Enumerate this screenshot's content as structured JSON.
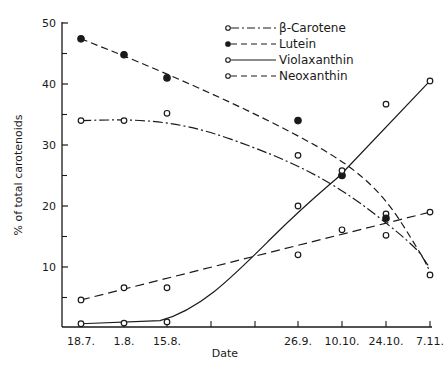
{
  "chart_data": {
    "type": "line",
    "title": "",
    "xlabel": "Date",
    "ylabel": "% of total carotenoids",
    "ylim": [
      0,
      50
    ],
    "yticks": [
      10,
      20,
      30,
      40,
      50
    ],
    "yminor_ticks": [
      5,
      15,
      25,
      35,
      45
    ],
    "grid": false,
    "legend_position": "upper right",
    "categories": [
      "18.7.",
      "1.8.",
      "15.8.",
      "26.9.",
      "10.10.",
      "24.10.",
      "7.11."
    ],
    "x_unlabeled_ticks": 2,
    "series": [
      {
        "name": "β-Carotene",
        "marker": "open-circle",
        "line": "dash-dot",
        "values": [
          34.0,
          34.0,
          35.2,
          28.3,
          25.1,
          18.7,
          8.7
        ]
      },
      {
        "name": "Lutein",
        "marker": "filled-circle",
        "line": "dashed",
        "values": [
          47.4,
          44.8,
          41.0,
          34.0,
          25.0,
          18.0,
          null
        ]
      },
      {
        "name": "Violaxanthin",
        "marker": "open-circle",
        "line": "solid",
        "values": [
          0.7,
          0.8,
          1.0,
          20.0,
          25.8,
          36.7,
          40.5
        ]
      },
      {
        "name": "Neoxanthin",
        "marker": "open-circle",
        "line": "long-dash",
        "values": [
          4.6,
          6.6,
          6.6,
          12.0,
          16.1,
          15.2,
          19.0
        ]
      }
    ]
  },
  "axis": {
    "y_label": "% of total carotenoids",
    "x_label": "Date",
    "y_ticks": [
      "10",
      "20",
      "30",
      "40",
      "50"
    ],
    "x_ticks": [
      "18.7.",
      "1.8.",
      "15.8.",
      "26.9.",
      "10.10.",
      "24.10.",
      "7.11."
    ]
  },
  "legend": {
    "items": [
      "β-Carotene",
      "Lutein",
      "Violaxanthin",
      "Neoxanthin"
    ]
  },
  "colors": {
    "ink": "#1a1a1a",
    "background": "#ffffff"
  }
}
